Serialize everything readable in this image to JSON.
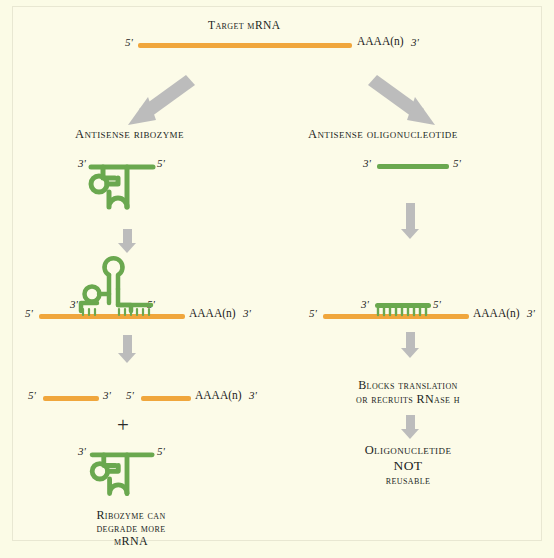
{
  "colors": {
    "background": "#fbfbe6",
    "panel": "#fcfbe8",
    "panel_border": "#e8e7d2",
    "mrna_orange": "#f0a63c",
    "ribozyme_green": "#6aa84f",
    "arrow_grey": "#bcbcbc",
    "text": "#1b1b1b"
  },
  "diagram": {
    "title": "Target mRNA",
    "target_mrna": {
      "left_label": "5'",
      "poly_a": "AAAA(n)",
      "right_label": "3'"
    },
    "branches": {
      "left": {
        "heading": "Antisense ribozyme",
        "free_ribozyme_top": {
          "left_end": "3'",
          "right_end": "5'"
        },
        "bound_complex": {
          "mrna_left_label": "5'",
          "ribozyme_left_end": "3'",
          "ribozyme_right_end": "5'",
          "poly_a": "AAAA(n)",
          "mrna_right_label": "3'"
        },
        "cleaved_products": {
          "fragment1_left": "5'",
          "fragment1_right": "3'",
          "fragment2_left": "5'",
          "fragment2_poly_a": "AAAA(n)",
          "fragment2_right": "3'"
        },
        "plus_symbol": "+",
        "regenerated_ribozyme": {
          "left_end": "3'",
          "right_end": "5'"
        },
        "conclusion_line1": "Ribozyme can",
        "conclusion_line2": "degrade more",
        "conclusion_line3": "mRNA"
      },
      "right": {
        "heading": "Antisense oligonucleotide",
        "free_oligo": {
          "left_end": "3'",
          "right_end": "5'"
        },
        "bound_complex": {
          "mrna_left_label": "5'",
          "oligo_left_end": "3'",
          "oligo_right_end": "5'",
          "poly_a": "AAAA(n)",
          "mrna_right_label": "3'"
        },
        "outcome_line1": "Blocks translation",
        "outcome_line2": "or recruits RNase h",
        "conclusion_line1": "Oligonucletide",
        "conclusion_line2": "NOT",
        "conclusion_line3": "reusable"
      }
    }
  }
}
